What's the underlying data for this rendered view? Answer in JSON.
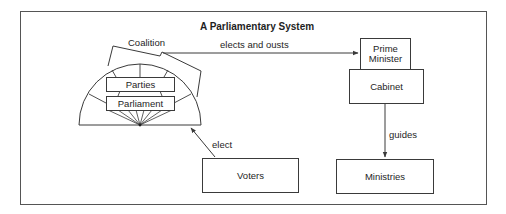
{
  "title": "A Parliamentary System",
  "nodes": {
    "coalition": {
      "label": "Coalition"
    },
    "parties": {
      "label": "Parties"
    },
    "parliament": {
      "label": "Parliament"
    },
    "prime_minister": {
      "label_line1": "Prime",
      "label_line2": "Minister"
    },
    "cabinet": {
      "label": "Cabinet"
    },
    "voters": {
      "label": "Voters"
    },
    "ministries": {
      "label": "Ministries"
    }
  },
  "edges": [
    {
      "from": "coalition",
      "to": "prime_minister",
      "label": "elects and ousts"
    },
    {
      "from": "cabinet",
      "to": "ministries",
      "label": "guides"
    },
    {
      "from": "voters",
      "to": "parliament",
      "label": "elect"
    }
  ],
  "colors": {
    "stroke": "#3a3a3a",
    "frame": "#555555",
    "text": "#1e1e1e",
    "background": "#ffffff"
  }
}
